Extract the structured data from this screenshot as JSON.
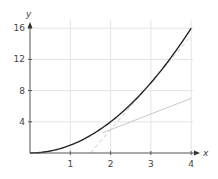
{
  "chart_data": {
    "type": "line",
    "title": "",
    "xlabel": "x",
    "ylabel": "y",
    "xlim": [
      0,
      4
    ],
    "ylim": [
      0,
      17
    ],
    "grid": true,
    "x_ticks": [
      "1",
      "2",
      "3",
      "4"
    ],
    "y_ticks": [
      "4",
      "8",
      "12",
      "16"
    ],
    "series": [
      {
        "name": "curve y = x^2",
        "style": "solid-dark",
        "x": [
          0,
          0.5,
          1,
          1.5,
          2,
          2.5,
          3,
          3.5,
          4
        ],
        "y": [
          0,
          0.25,
          1,
          2.25,
          4,
          6.25,
          9,
          12.25,
          16
        ]
      },
      {
        "name": "tangent at x=3 (y = 6x - 9)",
        "style": "dashed-light",
        "x": [
          1.5,
          4
        ],
        "y": [
          0,
          15
        ]
      },
      {
        "name": "tangent at x=1 (y = 2x - 1)",
        "style": "solid-light",
        "x": [
          1.8,
          4
        ],
        "y": [
          2.6,
          7
        ]
      }
    ],
    "colors": {
      "curve": "#222222",
      "tangent": "#c8c8c8",
      "grid": "#e4e4e4",
      "axis": "#555555"
    }
  }
}
